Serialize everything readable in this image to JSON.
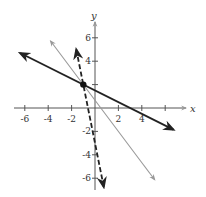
{
  "chart_data": {
    "type": "line",
    "title": "",
    "xlabel": "x",
    "ylabel": "y",
    "xlim": [
      -7,
      7
    ],
    "ylim": [
      -7,
      7
    ],
    "grid": false,
    "x_ticks": [
      -6,
      -4,
      -2,
      2,
      4
    ],
    "y_ticks": [
      6,
      4,
      -2,
      -4,
      -6
    ],
    "x_tick_labels": [
      "-6",
      "-4",
      "-2",
      "2",
      "4"
    ],
    "y_tick_labels": [
      "6",
      "4",
      "-2",
      "-4",
      "-6"
    ],
    "series": [
      {
        "name": "line-black-solid",
        "style": "solid",
        "color": "#222222",
        "slope": -0.5,
        "intercept": 1.5,
        "x": [
          -6.4,
          6.7
        ],
        "y": [
          4.7,
          -1.85
        ]
      },
      {
        "name": "line-gray-solid",
        "style": "solid",
        "color": "#999999",
        "slope": -1.333,
        "intercept": 0.667,
        "x": [
          -3.8,
          5.1
        ],
        "y": [
          5.73,
          -6.13
        ]
      },
      {
        "name": "line-black-dashed",
        "style": "dashed",
        "color": "#222222",
        "slope": -5,
        "intercept": -3,
        "x": [
          -1.6,
          0.75
        ],
        "y": [
          5.0,
          -6.75
        ]
      }
    ],
    "points": [
      {
        "x": -1,
        "y": 2,
        "label": "intersection"
      }
    ]
  },
  "labels": {
    "x": "x",
    "y": "y"
  }
}
